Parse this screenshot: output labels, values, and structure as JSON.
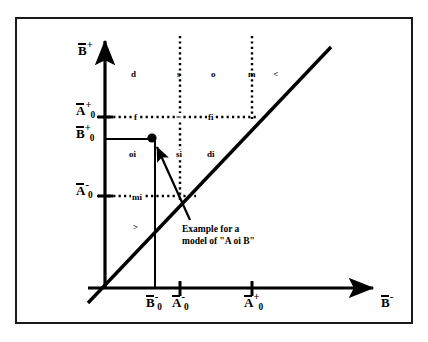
{
  "figure": {
    "type": "allen-interval-relations-plane",
    "background": "#ffffff",
    "ink": "#000000",
    "frame": {
      "x": 15,
      "y": 17,
      "width": 398,
      "height": 307,
      "border_px": 2
    }
  },
  "axes": {
    "y_axis": {
      "label_base": "B",
      "label_sup": "+",
      "overbar": true,
      "x_px": 105,
      "top_px": 36,
      "bottom_px": 288
    },
    "x_axis": {
      "label_base": "B",
      "label_sup": "-",
      "overbar": true,
      "y_px": 288,
      "left_px": 88,
      "right_px": 378
    }
  },
  "y_ticks": [
    {
      "id": "A0plus",
      "base": "A",
      "sub": "0",
      "sup": "+",
      "overbar": true,
      "y_px": 117
    },
    {
      "id": "B0plus",
      "base": "B",
      "sub": "0",
      "sup": "+",
      "overbar": true,
      "y_px": 139
    },
    {
      "id": "A0minus",
      "base": "A",
      "sub": "0",
      "sup": "-",
      "overbar": true,
      "y_px": 196
    }
  ],
  "x_ticks": [
    {
      "id": "B0minus",
      "base": "B",
      "sub": "0",
      "sup": "-",
      "overbar": true,
      "x_px": 155
    },
    {
      "id": "A0minus",
      "base": "A",
      "sub": "0",
      "sup": "-",
      "overbar": true,
      "x_px": 180
    },
    {
      "id": "A0plus",
      "base": "A",
      "sub": "0",
      "sup": "+",
      "overbar": true,
      "x_px": 252
    }
  ],
  "relation_labels": [
    {
      "text": "d",
      "x": 131,
      "y": 75
    },
    {
      "text": "s",
      "x": 177,
      "y": 75
    },
    {
      "text": "o",
      "x": 211,
      "y": 75
    },
    {
      "text": "m",
      "x": 249,
      "y": 75
    },
    {
      "text": "<",
      "x": 273,
      "y": 75
    },
    {
      "text": "f",
      "x": 133,
      "y": 122
    },
    {
      "text": "=",
      "x": 177,
      "y": 122
    },
    {
      "text": "fi",
      "x": 209,
      "y": 122
    },
    {
      "text": "oi",
      "x": 131,
      "y": 155
    },
    {
      "text": "si",
      "x": 177,
      "y": 155
    },
    {
      "text": "di",
      "x": 208,
      "y": 155
    },
    {
      "text": "mi",
      "x": 133,
      "y": 201
    },
    {
      "text": ">",
      "x": 133,
      "y": 228
    }
  ],
  "caption": {
    "line1": "Example for a",
    "line2": "model of \"A oi B\"",
    "x": 182,
    "y": 228
  },
  "point": {
    "name": "model-point",
    "x_px": 152,
    "y_px": 138,
    "radius_px": 4.5,
    "filled": true
  },
  "dotted_verticals": [
    {
      "x_px": 180,
      "y1": 36,
      "y2": 196
    },
    {
      "x_px": 252,
      "y1": 36,
      "y2": 117
    }
  ],
  "dotted_horizontals": [
    {
      "y_px": 117,
      "x1": 97,
      "x2": 258
    },
    {
      "y_px": 196,
      "x1": 97,
      "x2": 196
    }
  ],
  "solid_guides": [
    {
      "name": "B0plus-horizontal",
      "x1": 105,
      "y1": 139,
      "x2": 155,
      "y2": 139
    },
    {
      "name": "B0minus-vertical",
      "x1": 155,
      "y1": 139,
      "x2": 155,
      "y2": 288
    }
  ],
  "diagonal": {
    "name": "identity-line",
    "x1": 88,
    "y1": 303,
    "x2": 330,
    "y2": 48
  },
  "pointer_arrow": {
    "name": "caption-pointer",
    "from_x": 188,
    "from_y": 218,
    "to_x": 155,
    "to_y": 144
  }
}
